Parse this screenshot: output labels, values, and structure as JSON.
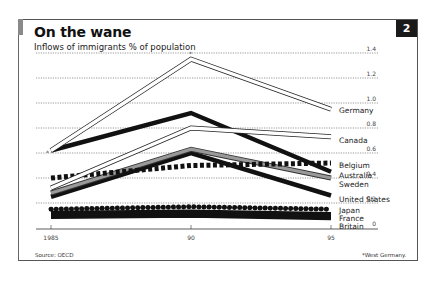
{
  "header": {
    "title": "On the wane",
    "subtitle": "Inflows of immigrants % of population",
    "chart_number": "2"
  },
  "footer": {
    "source": "Source: OECD",
    "footnote": "*West Germany."
  },
  "chart_data": {
    "type": "line",
    "title": "On the wane",
    "subtitle": "Inflows of immigrants % of population",
    "xlabel": "",
    "ylabel": "% of population",
    "x": [
      "1985",
      "90",
      "95"
    ],
    "yticks": [
      "0",
      "0.2",
      "0.4",
      "0.6",
      "0.8",
      "1.0",
      "1.2",
      "1.4"
    ],
    "ylim": [
      0,
      1.4
    ],
    "grid": "horizontal dotted",
    "legend_position": "direct labels at right end of lines",
    "series": [
      {
        "name": "Germany",
        "values": [
          0.62,
          1.35,
          0.95
        ],
        "style": "white outlined"
      },
      {
        "name": "Canada",
        "values": [
          0.32,
          0.8,
          0.73
        ],
        "style": "white outlined"
      },
      {
        "name": "Belgium",
        "values": [
          0.4,
          0.5,
          0.52
        ],
        "style": "black squares"
      },
      {
        "name": "Australia",
        "values": [
          0.62,
          0.92,
          0.45
        ],
        "style": "thick black"
      },
      {
        "name": "Sweden",
        "values": [
          0.28,
          0.63,
          0.4
        ],
        "style": "grey outlined"
      },
      {
        "name": "United States",
        "values": [
          0.25,
          0.6,
          0.26
        ],
        "style": "thick black"
      },
      {
        "name": "Japan",
        "values": [
          0.15,
          0.17,
          0.15
        ],
        "style": "black dots"
      },
      {
        "name": "France",
        "values": [
          0.12,
          0.13,
          0.11
        ],
        "style": "thick black"
      },
      {
        "name": "Britain",
        "values": [
          0.09,
          0.1,
          0.08
        ],
        "style": "thick black"
      }
    ],
    "annotations": [
      "* at Germany 1985 and 1990 points: West Germany"
    ]
  }
}
